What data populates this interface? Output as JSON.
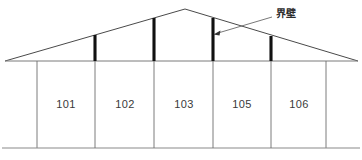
{
  "diagram": {
    "type": "building-section-elevation",
    "background_color": "#ffffff",
    "canvas": {
      "width": 362,
      "height": 160
    },
    "rooms": [
      {
        "label": "101",
        "cx": 66,
        "cy": 105
      },
      {
        "label": "102",
        "cx": 125,
        "cy": 105
      },
      {
        "label": "103",
        "cx": 184,
        "cy": 105
      },
      {
        "label": "105",
        "cx": 242,
        "cy": 105
      },
      {
        "label": "106",
        "cx": 299,
        "cy": 105
      }
    ],
    "annotation": {
      "label": "界壁",
      "label_x": 276,
      "label_y": 14,
      "leader_from_x": 272,
      "leader_from_y": 17,
      "leader_to_x": 218,
      "leader_to_y": 33,
      "arrow_tip_x": 214,
      "arrow_tip_y": 34
    },
    "geometry": {
      "roof_apex_x": 185,
      "roof_apex_y": 9,
      "eave_y": 61,
      "eave_left_x": 5,
      "eave_right_x": 358,
      "ground_y": 148,
      "ground_left_x": 2,
      "ground_right_x": 360,
      "wall_left_x": 37,
      "wall_right_x": 326,
      "partition_x": [
        95,
        154,
        213,
        271
      ]
    },
    "colors": {
      "partition_wall": "#111111",
      "roof_line": "#4a4a4a",
      "thin_line": "#6e6e6e",
      "ground_line": "#8a8a8a",
      "room_text": "#3a3a3a",
      "callout_text": "#2b2b2b"
    }
  }
}
